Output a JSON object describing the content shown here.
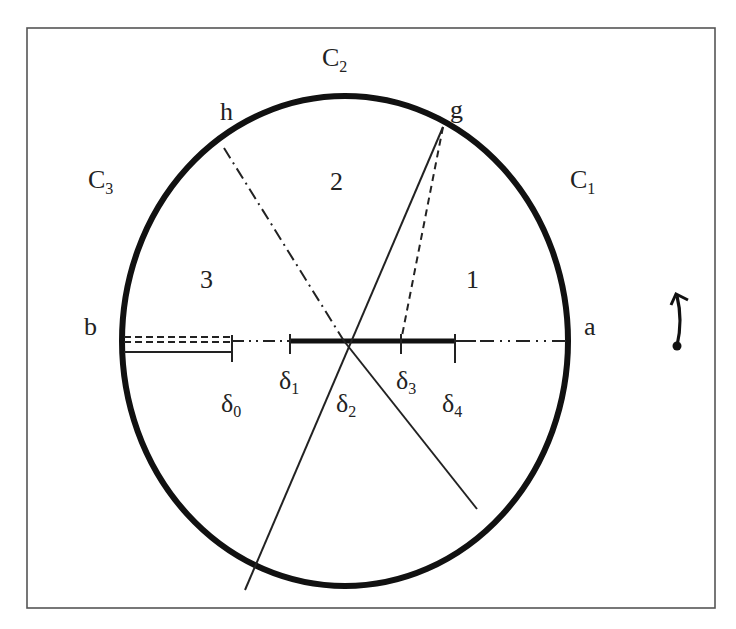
{
  "diagram": {
    "frame": {
      "x": 27,
      "y": 28,
      "width": 688,
      "height": 580,
      "stroke": "#555555"
    },
    "ellipse": {
      "cx": 345,
      "cy": 341,
      "rx": 223,
      "ry": 245,
      "stroke": "#111111",
      "stroke_width": 6
    },
    "regions": {
      "c1": {
        "main": "C",
        "sub": "1"
      },
      "c2": {
        "main": "C",
        "sub": "2"
      },
      "c3": {
        "main": "C",
        "sub": "3"
      }
    },
    "sectors": {
      "one": "1",
      "two": "2",
      "three": "3"
    },
    "points": {
      "a": "a",
      "b": "b",
      "g": "g",
      "h": "h"
    },
    "deltas": {
      "d0": {
        "main": "δ",
        "sub": "0"
      },
      "d1": {
        "main": "δ",
        "sub": "1"
      },
      "d2": {
        "main": "δ",
        "sub": "2"
      },
      "d3": {
        "main": "δ",
        "sub": "3"
      },
      "d4": {
        "main": "δ",
        "sub": "4"
      }
    },
    "rotation_indicator": "counterclockwise-arrow"
  }
}
